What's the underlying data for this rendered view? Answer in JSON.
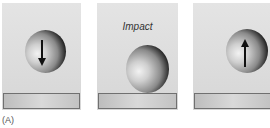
{
  "figure": {
    "label": "(A)",
    "panels": [
      {
        "id": "before",
        "caption": "",
        "arrow": "down-arrow"
      },
      {
        "id": "impact",
        "caption": "Impact",
        "arrow": ""
      },
      {
        "id": "after",
        "caption": "",
        "arrow": "up-arrow"
      }
    ]
  },
  "colors": {
    "background": "#ffffff",
    "panel": "#dcdcdc",
    "ball_dark": "#111111",
    "floor_border": "#707070",
    "arrow": "#111111"
  }
}
